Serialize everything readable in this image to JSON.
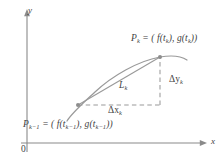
{
  "figure": {
    "kind": "parametric-arc-length-diagram",
    "background_color": "#ffffff",
    "ink_color": "#7a7a7a",
    "text_color": "#3f3f3f"
  },
  "axes": {
    "y_label": "y",
    "x_label": "x",
    "origin_label": "0",
    "y_axis": {
      "x": 27,
      "y_top": 12,
      "y_bottom": 152,
      "arrow": "up"
    },
    "x_axis": {
      "y": 143,
      "x_left": 21,
      "x_right": 206,
      "arrow": "right"
    }
  },
  "curve": {
    "name": "parametric-curve",
    "description": "smooth concave-down arc rising left to right",
    "path": "M 67,121 C 72,112 80,106 95,92 C 112,76 138,61 160,57 C 172,55 180,56 187,60"
  },
  "points": [
    {
      "name": "P_k-1",
      "label_text": "P",
      "label_sub": "k−1",
      "label_rest": " = ( f(t",
      "cx": 78,
      "cy": 105
    },
    {
      "name": "P_k",
      "label_text": "P",
      "label_sub": "k",
      "cx": 160,
      "cy": 57
    }
  ],
  "labels": {
    "point_k": {
      "p": "P",
      "sub_k": "k",
      "eq_open": " = ( f(t",
      "sub_k2": "k",
      "mid": "), g(t",
      "sub_k3": "k",
      "close": "))"
    },
    "point_k_minus_1": {
      "p": "P",
      "sub_km1": "k−1",
      "eq_open": " = ( f(t",
      "sub_km1b": "k−1",
      "mid": "), g(t",
      "sub_km1c": "k−1",
      "close": "))"
    },
    "chord": {
      "symbol": "L",
      "sub": "k"
    },
    "delta_x": {
      "symbol": "Δx",
      "sub": "k"
    },
    "delta_y": {
      "symbol": "Δy",
      "sub": "k"
    }
  },
  "segments": {
    "chord": {
      "name": "chord-L-k",
      "x1": 78,
      "y1": 105,
      "x2": 160,
      "y2": 57,
      "style": "solid"
    },
    "delta_x": {
      "name": "dashed-delta-x",
      "x1": 78,
      "y1": 105,
      "x2": 160,
      "y2": 105,
      "style": "dashed"
    },
    "delta_y": {
      "name": "dashed-delta-y",
      "x1": 160,
      "y1": 105,
      "x2": 160,
      "y2": 57,
      "style": "dashed"
    }
  }
}
